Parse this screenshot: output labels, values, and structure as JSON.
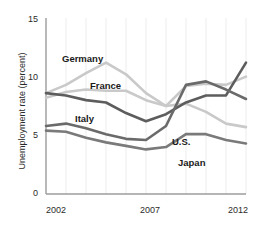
{
  "chart_data": {
    "type": "line",
    "title": "",
    "xlabel": "",
    "ylabel": "Unemployment rate (percent)",
    "xlim": [
      2002,
      2012
    ],
    "ylim": [
      0,
      15
    ],
    "yticks": [
      0,
      5,
      10,
      15
    ],
    "ytick_labels": [
      "0",
      "5",
      "10",
      "15"
    ],
    "xticks": [
      2002,
      2007,
      2012
    ],
    "xtick_labels": [
      "2002",
      "2007",
      "2012"
    ],
    "grid": "vertical-faint",
    "legend": "inline-labels",
    "x": [
      2002,
      2003,
      2004,
      2005,
      2006,
      2007,
      2008,
      2009,
      2010,
      2011,
      2012
    ],
    "series": [
      {
        "name": "Germany",
        "color": "#c9c9c9",
        "label": "Germany",
        "values": [
          8.6,
          9.3,
          10.3,
          11.2,
          10.2,
          8.6,
          7.5,
          7.7,
          7.0,
          6.0,
          5.7
        ]
      },
      {
        "name": "France",
        "color": "#c9c9c9",
        "label": "France",
        "values": [
          8.2,
          8.7,
          8.9,
          8.8,
          8.8,
          8.0,
          7.5,
          9.2,
          9.4,
          9.3,
          10.0
        ]
      },
      {
        "name": "Italy",
        "color": "#5d5d5d",
        "label": "Italy",
        "values": [
          8.6,
          8.4,
          8.0,
          7.8,
          6.9,
          6.2,
          6.8,
          7.8,
          8.4,
          8.4,
          11.2
        ]
      },
      {
        "name": "U.S.",
        "color": "#6a6a6a",
        "label": "U.S.",
        "values": [
          5.8,
          6.0,
          5.6,
          5.1,
          4.7,
          4.6,
          5.8,
          9.3,
          9.6,
          8.9,
          8.1
        ]
      },
      {
        "name": "Japan",
        "color": "#7a7a7a",
        "label": "Japan",
        "values": [
          5.4,
          5.3,
          4.8,
          4.4,
          4.1,
          3.8,
          4.0,
          5.1,
          5.1,
          4.6,
          4.3
        ]
      }
    ],
    "annotations": [
      {
        "text": "Germany",
        "x": 62,
        "y": 53
      },
      {
        "text": "France",
        "x": 90,
        "y": 80
      },
      {
        "text": "Italy",
        "x": 75,
        "y": 113
      },
      {
        "text": "U.S.",
        "x": 172,
        "y": 136
      },
      {
        "text": "Japan",
        "x": 178,
        "y": 157
      }
    ]
  },
  "axis": {
    "y_title": "Unemployment rate (percent)",
    "y_ticks": [
      "15",
      "10",
      "5",
      "0"
    ],
    "x_ticks": [
      "2002",
      "2007",
      "2012"
    ]
  },
  "cut_title": ""
}
